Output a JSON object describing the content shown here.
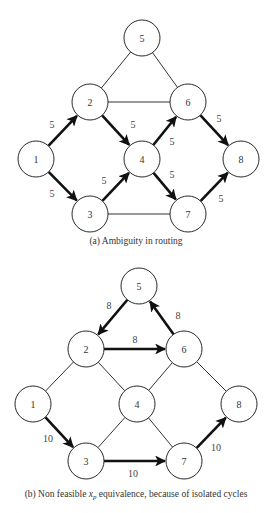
{
  "figures": [
    {
      "id": "a",
      "caption": "(a)  Ambiguity in routing",
      "caption_pos": [
        136,
        244
      ],
      "node_radius": 18,
      "nodes": [
        {
          "id": "1",
          "label": "1",
          "x": 36,
          "y": 159
        },
        {
          "id": "2",
          "label": "2",
          "x": 90,
          "y": 102
        },
        {
          "id": "3",
          "label": "3",
          "x": 90,
          "y": 214
        },
        {
          "id": "4",
          "label": "4",
          "x": 142,
          "y": 159
        },
        {
          "id": "5",
          "label": "5",
          "x": 142,
          "y": 38
        },
        {
          "id": "6",
          "label": "6",
          "x": 188,
          "y": 102
        },
        {
          "id": "7",
          "label": "7",
          "x": 188,
          "y": 214
        },
        {
          "id": "8",
          "label": "8",
          "x": 241,
          "y": 159
        }
      ],
      "edges": [
        {
          "from": "2",
          "to": "5",
          "directed": false
        },
        {
          "from": "5",
          "to": "6",
          "directed": false
        },
        {
          "from": "2",
          "to": "6",
          "directed": false
        },
        {
          "from": "3",
          "to": "7",
          "directed": false
        },
        {
          "from": "1",
          "to": "2",
          "directed": true,
          "label": "5",
          "lx": 52,
          "ly": 124
        },
        {
          "from": "1",
          "to": "3",
          "directed": true,
          "label": "5",
          "lx": 52,
          "ly": 193
        },
        {
          "from": "2",
          "to": "4",
          "directed": true,
          "label": "5",
          "lx": 133,
          "ly": 124
        },
        {
          "from": "3",
          "to": "4",
          "directed": true,
          "label": "5",
          "lx": 104,
          "ly": 180
        },
        {
          "from": "4",
          "to": "6",
          "directed": true,
          "label": "5",
          "lx": 172,
          "ly": 141
        },
        {
          "from": "4",
          "to": "7",
          "directed": true,
          "label": "5",
          "lx": 172,
          "ly": 174
        },
        {
          "from": "6",
          "to": "8",
          "directed": true,
          "label": "5",
          "lx": 219,
          "ly": 118
        },
        {
          "from": "7",
          "to": "8",
          "directed": true,
          "label": "5",
          "lx": 221,
          "ly": 198
        }
      ]
    },
    {
      "id": "b",
      "caption": "(b) Non feasible x_p equivalence, because of isolated cycles",
      "caption_main": "(b) Non feasible ",
      "caption_var": "x",
      "caption_sub": "p",
      "caption_rest": " equivalence, because of isolated cycles",
      "caption_pos": [
        136,
        497
      ],
      "node_radius": 18,
      "nodes": [
        {
          "id": "1",
          "label": "1",
          "x": 33,
          "y": 404
        },
        {
          "id": "2",
          "label": "2",
          "x": 86,
          "y": 349
        },
        {
          "id": "3",
          "label": "3",
          "x": 86,
          "y": 461
        },
        {
          "id": "4",
          "label": "4",
          "x": 137,
          "y": 404
        },
        {
          "id": "5",
          "label": "5",
          "x": 139,
          "y": 286
        },
        {
          "id": "6",
          "label": "6",
          "x": 184,
          "y": 349
        },
        {
          "id": "7",
          "label": "7",
          "x": 184,
          "y": 461
        },
        {
          "id": "8",
          "label": "8",
          "x": 239,
          "y": 404
        }
      ],
      "edges": [
        {
          "from": "1",
          "to": "2",
          "directed": false
        },
        {
          "from": "2",
          "to": "4",
          "directed": false
        },
        {
          "from": "3",
          "to": "4",
          "directed": false
        },
        {
          "from": "4",
          "to": "6",
          "directed": false
        },
        {
          "from": "4",
          "to": "7",
          "directed": false
        },
        {
          "from": "6",
          "to": "8",
          "directed": false
        },
        {
          "from": "5",
          "to": "2",
          "directed": true,
          "label": "8",
          "lx": 109,
          "ly": 305
        },
        {
          "from": "2",
          "to": "6",
          "directed": true,
          "label": "8",
          "lx": 135,
          "ly": 339
        },
        {
          "from": "6",
          "to": "5",
          "directed": true,
          "label": "8",
          "lx": 178,
          "ly": 315
        },
        {
          "from": "1",
          "to": "3",
          "directed": true,
          "label": "10",
          "lx": 48,
          "ly": 438
        },
        {
          "from": "3",
          "to": "7",
          "directed": true,
          "label": "10",
          "lx": 133,
          "ly": 473
        },
        {
          "from": "7",
          "to": "8",
          "directed": true,
          "label": "10",
          "lx": 216,
          "ly": 447
        }
      ]
    }
  ]
}
